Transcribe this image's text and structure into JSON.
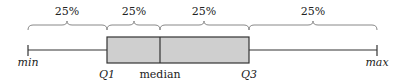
{
  "diagram": {
    "type": "box-plot-explanation",
    "colors": {
      "box_fill": "#cfcfcf",
      "stroke": "#333333",
      "brace": "#888888",
      "text": "#222222"
    },
    "positions": {
      "min": 28,
      "q1": 107,
      "median": 160,
      "q3": 249,
      "max": 377
    },
    "braces": [
      {
        "label": "25%",
        "from": "min",
        "to": "q1"
      },
      {
        "label": "25%",
        "from": "q1",
        "to": "median"
      },
      {
        "label": "25%",
        "from": "median",
        "to": "q3"
      },
      {
        "label": "25%",
        "from": "q3",
        "to": "max"
      }
    ],
    "labels": {
      "min": "min",
      "q1": "Q1",
      "median": "median",
      "q3": "Q3",
      "max": "max"
    }
  }
}
